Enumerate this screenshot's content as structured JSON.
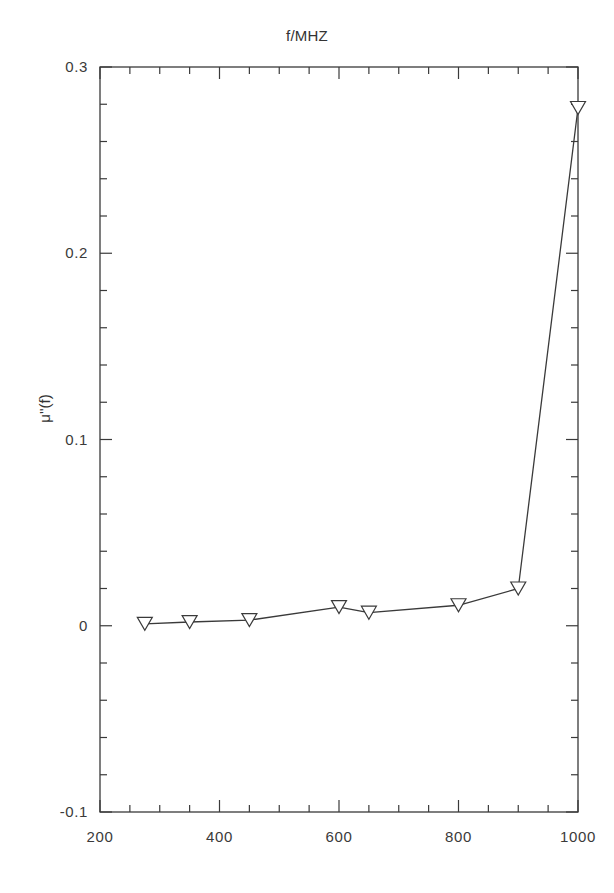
{
  "chart_data": {
    "type": "line",
    "title": "f/MHZ",
    "xlabel": "",
    "ylabel": "μ''(f)",
    "x": [
      275,
      350,
      450,
      600,
      650,
      800,
      900,
      1000
    ],
    "values": [
      0.001,
      0.002,
      0.003,
      0.01,
      0.007,
      0.011,
      0.02,
      0.278
    ],
    "series": [
      {
        "name": "μ''(f)",
        "marker": "triangle-down",
        "x": [
          275,
          350,
          450,
          600,
          650,
          800,
          900,
          1000
        ],
        "values": [
          0.001,
          0.002,
          0.003,
          0.01,
          0.007,
          0.011,
          0.02,
          0.278
        ]
      }
    ],
    "xlim": [
      200,
      1000
    ],
    "ylim": [
      -0.1,
      0.3
    ],
    "x_ticks": [
      200,
      400,
      600,
      800,
      1000
    ],
    "x_tick_labels": [
      "200",
      "400",
      "600",
      "800",
      "1000"
    ],
    "x_minor_step": 50,
    "y_ticks": [
      -0.1,
      0,
      0.1,
      0.2,
      0.3
    ],
    "y_tick_labels": [
      "-0.1",
      "0",
      "0.1",
      "0.2",
      "0.3"
    ],
    "y_minor_step": 0.02,
    "grid": false,
    "legend": "none",
    "line_color": "#3a3a3a",
    "marker_face_color": "#ffffff",
    "marker_edge_color": "#3a3a3a",
    "axis_color": "#3a3a3a",
    "background": "#ffffff"
  },
  "axis_labels": {
    "y_0": "0.3",
    "y_1": "0.2",
    "y_2": "0.1",
    "y_3": "0",
    "y_4": "-0.1",
    "x_0": "200",
    "x_1": "400",
    "x_2": "600",
    "x_3": "800",
    "x_4": "1000"
  }
}
